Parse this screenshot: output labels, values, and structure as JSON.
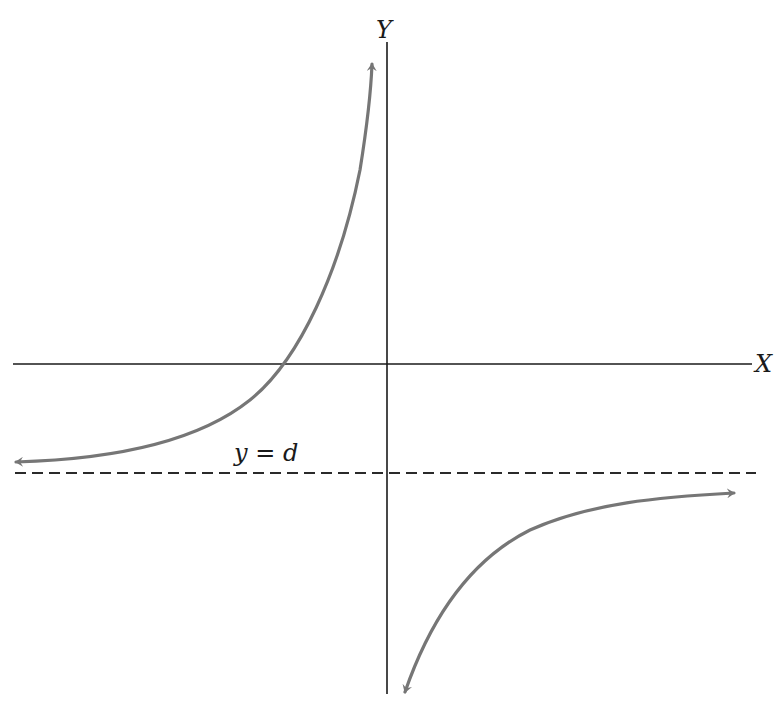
{
  "diagram": {
    "title": "",
    "type": "rectangular hyperbola graph",
    "axes": {
      "x_label": "X",
      "y_label": "Y"
    },
    "asymptote": {
      "label": "y = d",
      "style": "dashed",
      "orientation": "horizontal"
    },
    "curve_color": "#767676",
    "axis_color": "#1a1a1a",
    "branches": [
      {
        "name": "left-branch",
        "description": "Approaches y = d from above on the far left, crosses X axis left of origin, rises toward +infinity near the Y axis"
      },
      {
        "name": "right-branch",
        "description": "Descends toward -infinity just right of the Y axis, approaches y = d from below on the far right"
      }
    ]
  }
}
